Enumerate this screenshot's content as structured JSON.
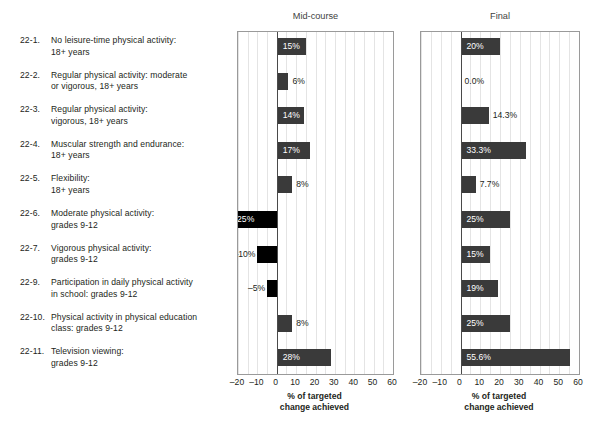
{
  "chart_data": {
    "type": "bar",
    "orientation": "horizontal",
    "title": "",
    "xlabel": "% of targeted change achieved",
    "ylabel": "",
    "xlim": [
      -20,
      60
    ],
    "xticks": [
      "–20",
      "–10",
      "0",
      "10",
      "20",
      "30",
      "40",
      "50",
      "60"
    ],
    "xtick_values": [
      -20,
      -10,
      0,
      10,
      20,
      30,
      40,
      50,
      60
    ],
    "grid": true,
    "grid_step": 5,
    "legend": "none",
    "panels": [
      "Mid-course",
      "Final"
    ],
    "categories": [
      "22-1. No leisure-time physical activity: 18+ years",
      "22-2. Regular physical activity: moderate or vigorous, 18+ years",
      "22-3. Regular physical activity: vigorous, 18+ years",
      "22-4. Muscular strength and endurance: 18+ years",
      "22-5. Flexibility: 18+ years",
      "22-6. Moderate physical activity: grades 9-12",
      "22-7. Vigorous physical activity: grades 9-12",
      "22-9. Participation in daily physical activity in school: grades 9-12",
      "22-10. Physical activity in physical education class: grades 9-12",
      "22-11. Television viewing: grades 9-12"
    ],
    "series": [
      {
        "name": "Mid-course",
        "values": [
          15,
          6,
          14,
          17,
          8,
          -25,
          -10,
          -5,
          8,
          28
        ],
        "labels": [
          "15%",
          "6%",
          "14%",
          "17%",
          "8%",
          "–25%",
          "–10%",
          "–5%",
          "8%",
          "28%"
        ]
      },
      {
        "name": "Final",
        "values": [
          20,
          0,
          14.3,
          33.3,
          7.7,
          25,
          15,
          19,
          25,
          55.6
        ],
        "labels": [
          "20%",
          "0.0%",
          "14.3%",
          "33.3%",
          "7.7%",
          "25%",
          "15%",
          "19%",
          "25%",
          "55.6%"
        ]
      }
    ]
  },
  "rows": [
    {
      "num": "22-1.",
      "line1": "No leisure-time physical activity:",
      "line2": "18+ years"
    },
    {
      "num": "22-2.",
      "line1": "Regular physical activity: moderate",
      "line2": "or vigorous, 18+ years"
    },
    {
      "num": "22-3.",
      "line1": "Regular physical activity:",
      "line2": "vigorous, 18+ years"
    },
    {
      "num": "22-4.",
      "line1": "Muscular strength and endurance:",
      "line2": "18+ years"
    },
    {
      "num": "22-5.",
      "line1": "Flexibility:",
      "line2": "18+ years"
    },
    {
      "num": "22-6.",
      "line1": "Moderate physical activity:",
      "line2": "grades 9-12"
    },
    {
      "num": "22-7.",
      "line1": "Vigorous physical activity:",
      "line2": "grades 9-12"
    },
    {
      "num": "22-9.",
      "line1": "Participation in daily physical activity",
      "line2": "in school: grades 9-12"
    },
    {
      "num": "22-10.",
      "line1": "Physical activity in physical education",
      "line2": "class: grades 9-12"
    },
    {
      "num": "22-11.",
      "line1": "Television viewing:",
      "line2": "grades 9-12"
    }
  ],
  "panels": [
    {
      "title": "Mid-course",
      "caption_line1": "% of targeted",
      "caption_line2": "change achieved"
    },
    {
      "title": "Final",
      "caption_line1": "% of targeted",
      "caption_line2": "change achieved"
    }
  ],
  "colors": {
    "bar_positive": "#3a3a3a",
    "bar_negative": "#000000",
    "grid": "#e4e4e4",
    "frame": "#9a9a9a",
    "zero_axis": "#4a4a4a",
    "text": "#231f20"
  }
}
